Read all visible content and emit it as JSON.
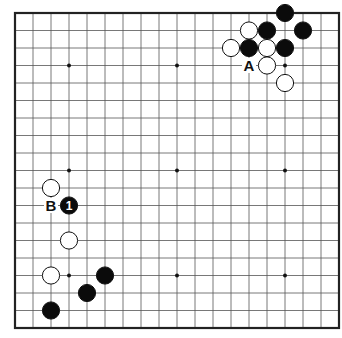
{
  "board": {
    "size": 19,
    "origin_x": 15,
    "origin_y": 13,
    "spacing_x": 18,
    "spacing_y": 17.5,
    "line_color": "#555555",
    "edge_color": "#222222",
    "star_points": [
      [
        3,
        3
      ],
      [
        9,
        3
      ],
      [
        15,
        3
      ],
      [
        3,
        9
      ],
      [
        9,
        9
      ],
      [
        15,
        9
      ],
      [
        3,
        15
      ],
      [
        9,
        15
      ],
      [
        15,
        15
      ]
    ]
  },
  "stones": [
    {
      "color": "black",
      "col": 15,
      "row": 0
    },
    {
      "color": "white",
      "col": 13,
      "row": 1
    },
    {
      "color": "black",
      "col": 14,
      "row": 1
    },
    {
      "color": "black",
      "col": 16,
      "row": 1
    },
    {
      "color": "white",
      "col": 12,
      "row": 2
    },
    {
      "color": "black",
      "col": 13,
      "row": 2
    },
    {
      "color": "white",
      "col": 14,
      "row": 2
    },
    {
      "color": "black",
      "col": 15,
      "row": 2
    },
    {
      "color": "white",
      "col": 14,
      "row": 3
    },
    {
      "color": "white",
      "col": 15,
      "row": 4
    },
    {
      "color": "white",
      "col": 2,
      "row": 10
    },
    {
      "color": "black",
      "col": 3,
      "row": 11,
      "number": "1"
    },
    {
      "color": "white",
      "col": 3,
      "row": 13
    },
    {
      "color": "white",
      "col": 2,
      "row": 15
    },
    {
      "color": "black",
      "col": 5,
      "row": 15
    },
    {
      "color": "black",
      "col": 4,
      "row": 16
    },
    {
      "color": "black",
      "col": 2,
      "row": 17
    }
  ],
  "labels": [
    {
      "text": "A",
      "col": 13,
      "row": 3
    },
    {
      "text": "B",
      "col": 2,
      "row": 11
    }
  ]
}
